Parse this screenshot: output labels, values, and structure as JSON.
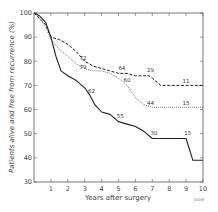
{
  "chart_data": {
    "type": "line",
    "title": "",
    "xlabel": "Years after surgery",
    "ylabel": "Patients alive and free from recurrence (%)",
    "xlim": [
      0,
      10
    ],
    "ylim": [
      30,
      100
    ],
    "x_ticks": [
      "1",
      "2",
      "3",
      "4",
      "5",
      "6",
      "7",
      "8",
      "9",
      "10"
    ],
    "y_ticks": [
      "30",
      "40",
      "50",
      "60",
      "70",
      "80",
      "90",
      "100"
    ],
    "grid": false,
    "legend": null,
    "credit": "3318F",
    "series": [
      {
        "name": "dashed",
        "style": "dashed",
        "points": [
          [
            0,
            100
          ],
          [
            0.3,
            98
          ],
          [
            0.7,
            95
          ],
          [
            1,
            90
          ],
          [
            1.5,
            89
          ],
          [
            2,
            87
          ],
          [
            2.5,
            84
          ],
          [
            3,
            80
          ],
          [
            3.5,
            78
          ],
          [
            4,
            77
          ],
          [
            4.5,
            76
          ],
          [
            5,
            75
          ],
          [
            5.5,
            75
          ],
          [
            6,
            74
          ],
          [
            6.8,
            74
          ],
          [
            7,
            73
          ],
          [
            7.5,
            70
          ],
          [
            8,
            70
          ],
          [
            9,
            70
          ],
          [
            10,
            70
          ]
        ],
        "labels": [
          {
            "text": "72",
            "x": 2.9,
            "y": 80.5
          },
          {
            "text": "64",
            "x": 5.2,
            "y": 76.5
          },
          {
            "text": "29",
            "x": 6.9,
            "y": 75.5
          },
          {
            "text": "11",
            "x": 9.0,
            "y": 71
          }
        ]
      },
      {
        "name": "dotted",
        "style": "dotted",
        "points": [
          [
            0,
            100
          ],
          [
            0.3,
            98
          ],
          [
            0.7,
            94
          ],
          [
            1,
            89
          ],
          [
            1.5,
            85
          ],
          [
            2,
            82
          ],
          [
            2.5,
            79
          ],
          [
            3,
            77
          ],
          [
            3.5,
            76
          ],
          [
            4,
            76
          ],
          [
            4.5,
            75
          ],
          [
            5,
            73
          ],
          [
            5.5,
            70
          ],
          [
            6,
            65
          ],
          [
            6.5,
            62
          ],
          [
            7,
            61
          ],
          [
            8,
            61
          ],
          [
            9,
            61
          ],
          [
            10,
            61
          ]
        ],
        "labels": [
          {
            "text": "79",
            "x": 2.9,
            "y": 77
          },
          {
            "text": "60",
            "x": 5.5,
            "y": 71.5
          },
          {
            "text": "44",
            "x": 6.9,
            "y": 62
          },
          {
            "text": "15",
            "x": 9.0,
            "y": 62
          }
        ]
      },
      {
        "name": "solid",
        "style": "solid",
        "points": [
          [
            0,
            100
          ],
          [
            0.3,
            99
          ],
          [
            0.7,
            96
          ],
          [
            1,
            90
          ],
          [
            1.3,
            82
          ],
          [
            1.6,
            76
          ],
          [
            2,
            74
          ],
          [
            2.5,
            72
          ],
          [
            3,
            69
          ],
          [
            3.3,
            66
          ],
          [
            3.6,
            62
          ],
          [
            4,
            59
          ],
          [
            4.5,
            58
          ],
          [
            5,
            55
          ],
          [
            5.5,
            54
          ],
          [
            6,
            53
          ],
          [
            6.5,
            51
          ],
          [
            7,
            48
          ],
          [
            7.5,
            48
          ],
          [
            8,
            48
          ],
          [
            9,
            48
          ],
          [
            9.4,
            39
          ],
          [
            10,
            39
          ]
        ],
        "labels": [
          {
            "text": "62",
            "x": 3.4,
            "y": 67
          },
          {
            "text": "55",
            "x": 5.1,
            "y": 56.5
          },
          {
            "text": "30",
            "x": 7.1,
            "y": 49.5
          },
          {
            "text": "15",
            "x": 9.1,
            "y": 49.5
          }
        ]
      }
    ]
  }
}
